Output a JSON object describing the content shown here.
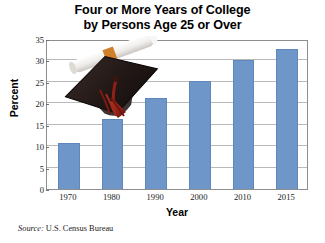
{
  "figure": {
    "title_line1": "Four or More Years of College",
    "title_line2": "by Persons Age 25 or Over",
    "source": "Source: U.S. Census Bureau",
    "source_prefix": "Source:",
    "source_body": " U.S. Census Bureau",
    "decoration": "graduation-cap-and-diploma"
  },
  "colors": {
    "bar_fill": "#6f96c8",
    "bar_edge": "#5d87bd",
    "gridline": "#b9b9b9",
    "axis": "#8d8d8d",
    "text": "#000000",
    "background": "#ffffff",
    "cap_body": "#241a18",
    "tassel": "#8e2018",
    "diploma": "#f2f0ec",
    "diploma_band": "#d0802a"
  },
  "chart_data": {
    "type": "bar",
    "title": "Four or More Years of College by Persons Age 25 or Over",
    "categories": [
      "1970",
      "1980",
      "1990",
      "2000",
      "2010",
      "2015"
    ],
    "values": [
      10.7,
      16.3,
      21.3,
      25.3,
      30.0,
      32.6
    ],
    "xlabel": "Year",
    "ylabel": "Percent",
    "ylim": [
      0,
      35
    ],
    "yticks": [
      0,
      5,
      10,
      15,
      20,
      25,
      30,
      35
    ],
    "ytick_labels": [
      "0",
      "5",
      "10",
      "15",
      "20",
      "25",
      "30",
      "35"
    ],
    "grid": true,
    "grid_axis": "y",
    "legend": false,
    "source": "U.S. Census Bureau"
  }
}
